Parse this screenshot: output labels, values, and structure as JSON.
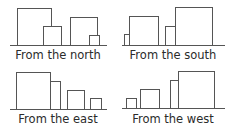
{
  "panels": [
    {
      "caption": "From the north",
      "baseline": {
        "x1": 10,
        "x2": 107,
        "y": 45.5
      },
      "caption_pos": {
        "x": 58,
        "y": 59
      },
      "rects": [
        {
          "x": 17.5,
          "y": 8.5,
          "w": 34,
          "h": 37
        },
        {
          "x": 43.5,
          "y": 26.5,
          "w": 18,
          "h": 19
        },
        {
          "x": 70.5,
          "y": 17.5,
          "w": 27,
          "h": 28
        },
        {
          "x": 89.5,
          "y": 35.5,
          "w": 10,
          "h": 10
        }
      ]
    },
    {
      "caption": "From the south",
      "baseline": {
        "x1": 122,
        "x2": 225,
        "y": 45.5
      },
      "caption_pos": {
        "x": 173,
        "y": 59
      },
      "rects": [
        {
          "x": 124.5,
          "y": 34.5,
          "w": 5,
          "h": 11
        },
        {
          "x": 129.5,
          "y": 16.5,
          "w": 29,
          "h": 29
        },
        {
          "x": 165.5,
          "y": 26.5,
          "w": 10,
          "h": 19
        },
        {
          "x": 175.5,
          "y": 7.5,
          "w": 37,
          "h": 38
        }
      ]
    },
    {
      "caption": "From the east",
      "baseline": {
        "x1": 10,
        "x2": 107,
        "y": 109.5
      },
      "caption_pos": {
        "x": 58,
        "y": 123
      },
      "rects": [
        {
          "x": 16.5,
          "y": 72.5,
          "w": 34,
          "h": 37
        },
        {
          "x": 50.5,
          "y": 81.5,
          "w": 10,
          "h": 28
        },
        {
          "x": 67.5,
          "y": 90.5,
          "w": 17,
          "h": 19
        },
        {
          "x": 90.5,
          "y": 98.5,
          "w": 11,
          "h": 11
        }
      ]
    },
    {
      "caption": "From the west",
      "baseline": {
        "x1": 122,
        "x2": 225,
        "y": 108.5
      },
      "caption_pos": {
        "x": 173,
        "y": 123
      },
      "rects": [
        {
          "x": 126.5,
          "y": 98.5,
          "w": 10,
          "h": 10
        },
        {
          "x": 140.5,
          "y": 89.5,
          "w": 19,
          "h": 19
        },
        {
          "x": 170.5,
          "y": 80.5,
          "w": 28,
          "h": 28
        },
        {
          "x": 178.5,
          "y": 71.5,
          "w": 36,
          "h": 37
        }
      ]
    }
  ]
}
